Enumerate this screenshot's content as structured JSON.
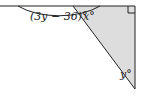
{
  "diagram": {
    "type": "geometry-angles",
    "labels": {
      "left_angle": "(3y − 36)°",
      "top_angle": "x°",
      "bottom_angle": "y°"
    },
    "elements": [
      "horizontal-line",
      "vertical-line",
      "diagonal-transversal",
      "shaded-triangle",
      "angle-arc",
      "right-angle-marker"
    ],
    "colors": {
      "stroke": "#222222",
      "shading": "#dddddd",
      "background": "#ffffff"
    }
  }
}
